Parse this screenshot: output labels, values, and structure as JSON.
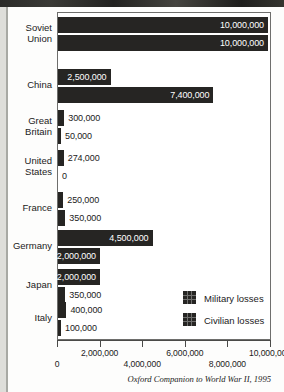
{
  "figure": {
    "source_note": "Oxford Companion to World War II, 1995"
  },
  "chart_data": {
    "type": "bar",
    "orientation": "horizontal",
    "title": "",
    "xlabel": "",
    "ylabel": "",
    "xlim": [
      0,
      10000000
    ],
    "grid": false,
    "legend_position": "inside-bottom-right",
    "categories": [
      "Soviet Union",
      "China",
      "Great Britain",
      "United States",
      "France",
      "Germany",
      "Japan",
      "Italy"
    ],
    "series": [
      {
        "name": "Military losses",
        "color": "#262523",
        "values": [
          10000000,
          2500000,
          300000,
          274000,
          250000,
          4500000,
          2000000,
          400000
        ],
        "labels": [
          "10,000,000",
          "2,500,000",
          "300,000",
          "274,000",
          "250,000",
          "4,500,000",
          "2,000,000",
          "400,000"
        ]
      },
      {
        "name": "Civilian losses",
        "color": "#262523",
        "values": [
          10000000,
          7400000,
          50000,
          0,
          350000,
          2000000,
          350000,
          100000
        ],
        "labels": [
          "10,000,000",
          "7,400,000",
          "50,000",
          "0",
          "350,000",
          "2,000,000",
          "350,000",
          "100,000"
        ]
      }
    ],
    "xticks": [
      0,
      2000000,
      4000000,
      6000000,
      8000000,
      10000000
    ],
    "xtick_labels": [
      "0",
      "2,000,000",
      "4,000,000",
      "6,000,000",
      "8,000,000",
      "10,000,000"
    ]
  },
  "rows": [
    {
      "label_line1": "Soviet",
      "label_line2": "Union",
      "military": {
        "value": 10000000,
        "label": "10,000,000",
        "inside": true
      },
      "civilian": {
        "value": 10000000,
        "label": "10,000,000",
        "inside": true
      }
    },
    {
      "label_line1": "China",
      "label_line2": "",
      "military": {
        "value": 2500000,
        "label": "2,500,000",
        "inside": true
      },
      "civilian": {
        "value": 7400000,
        "label": "7,400,000",
        "inside": true
      }
    },
    {
      "label_line1": "Great",
      "label_line2": "Britain",
      "military": {
        "value": 300000,
        "label": "300,000",
        "inside": false
      },
      "civilian": {
        "value": 50000,
        "label": "50,000",
        "inside": false
      }
    },
    {
      "label_line1": "United",
      "label_line2": "States",
      "military": {
        "value": 274000,
        "label": "274,000",
        "inside": false
      },
      "civilian": {
        "value": 0,
        "label": "0",
        "inside": false
      }
    },
    {
      "label_line1": "France",
      "label_line2": "",
      "military": {
        "value": 250000,
        "label": "250,000",
        "inside": false
      },
      "civilian": {
        "value": 350000,
        "label": "350,000",
        "inside": false
      }
    },
    {
      "label_line1": "Germany",
      "label_line2": "",
      "military": {
        "value": 4500000,
        "label": "4,500,000",
        "inside": true
      },
      "civilian": {
        "value": 2000000,
        "label": "2,000,000",
        "inside": true
      }
    },
    {
      "label_line1": "Japan",
      "label_line2": "",
      "military": {
        "value": 2000000,
        "label": "2,000,000",
        "inside": true
      },
      "civilian": {
        "value": 350000,
        "label": "350,000",
        "inside": false
      }
    },
    {
      "label_line1": "Italy",
      "label_line2": "",
      "military": {
        "value": 400000,
        "label": "400,000",
        "inside": false
      },
      "civilian": {
        "value": 100000,
        "label": "100,000",
        "inside": false
      }
    }
  ],
  "legend": {
    "items": [
      {
        "label": "Military losses"
      },
      {
        "label": "Civilian losses"
      }
    ]
  },
  "axis": {
    "ticks": [
      {
        "label": "0",
        "value": 0,
        "row": "hi"
      },
      {
        "label": "2,000,000",
        "value": 2000000,
        "row": "lo"
      },
      {
        "label": "4,000,000",
        "value": 4000000,
        "row": "hi"
      },
      {
        "label": "6,000,000",
        "value": 6000000,
        "row": "lo"
      },
      {
        "label": "8,000,000",
        "value": 8000000,
        "row": "hi"
      },
      {
        "label": "10,000,000",
        "value": 10000000,
        "row": "lo"
      }
    ]
  }
}
